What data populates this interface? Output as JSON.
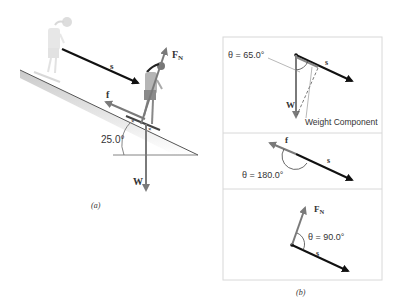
{
  "figure": {
    "panel_a": {
      "caption": "(a)",
      "incline_angle_label": "25.0°",
      "vectors": {
        "displacement": "s",
        "friction": "f",
        "normal_force": "F",
        "normal_force_sub": "N",
        "weight": "W"
      }
    },
    "panel_b": {
      "caption": "(b)",
      "diagrams": [
        {
          "theta_label": "θ = 65.0°",
          "vector": "W",
          "displacement": "s",
          "annotation": "Weight Component"
        },
        {
          "theta_label": "θ = 180.0°",
          "vector": "f",
          "displacement": "s"
        },
        {
          "theta_label": "θ = 90.0°",
          "vector": "F",
          "vector_sub": "N",
          "displacement": "s"
        }
      ]
    },
    "colors": {
      "displacement_arrow": "#111111",
      "force_arrow": "#7a7a7a",
      "panel_border": "#d8d8d8",
      "incline_shadow": "#cfcfcf"
    }
  }
}
